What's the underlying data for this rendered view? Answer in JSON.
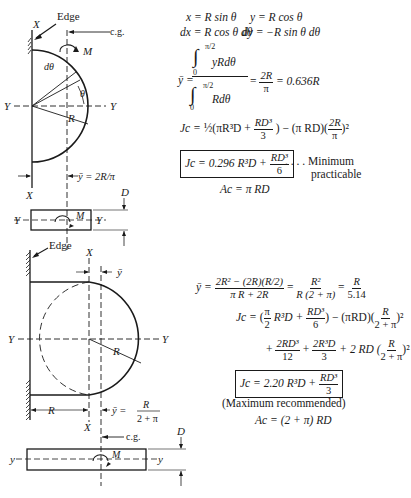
{
  "diagram_top": {
    "labels": {
      "edge": "Edge",
      "cg": "c.g.",
      "x_top": "X",
      "x_bottom": "X",
      "y_left": "Y",
      "y_right": "Y",
      "moment": "M",
      "dtheta": "dθ",
      "theta": "θ",
      "radius": "R",
      "ybar": "ȳ = 2R/π",
      "section_y_left": "Y",
      "section_y_right": "Y",
      "section_moment": "M",
      "depth": "D"
    }
  },
  "equations_top": {
    "line1_left": "x = R sin θ",
    "line1_right": "y = R cos θ",
    "line2_left": "dx = R cos θ dθ",
    "line2_right": "dy = −R sin θ dθ",
    "ybar_lhs": "ȳ =",
    "int_upper": "π/2",
    "int_lower": "0",
    "int_num": "yRdθ",
    "int_den": "Rdθ",
    "ybar_result_num": "2R",
    "ybar_result_den": "π",
    "ybar_value": "= 0.636R",
    "jc_full": "J_c = ½(πR³D + RD³/3) − (πRD)(2R/π)²",
    "jc_lhs": "Jc =",
    "jc_part1": "½(πR³D +",
    "jc_frac_num": "RD³",
    "jc_frac_den": "3",
    "jc_part2": ") − (π RD)(",
    "jc_frac2_num": "2R",
    "jc_frac2_den": "π",
    "jc_part3": ")²",
    "boxed_lhs": "Jc = 0.296 R³D +",
    "boxed_frac_num": "RD³",
    "boxed_frac_den": "6",
    "note_line1": ". . . . Minimum",
    "note_line2": "practicable",
    "area": "Ac = π RD"
  },
  "diagram_bottom": {
    "labels": {
      "edge": "Edge",
      "x_top": "X",
      "x_bottom": "X",
      "ybar_top": "ȳ",
      "y_left": "Y",
      "y_right": "Y",
      "radius": "R",
      "dim_r": "R",
      "ybar_eq": "ȳ =",
      "ybar_num": "R",
      "ybar_den": "2 + π",
      "cg": "c.g.",
      "section_y_left": "y",
      "section_y_right": "y",
      "section_moment": "M",
      "depth": "D"
    }
  },
  "equations_bottom": {
    "ybar_lhs": "ȳ =",
    "ybar_num1": "2R² − (2R)(R/2)",
    "ybar_den1": "π R + 2R",
    "ybar_num2": "R²",
    "ybar_den2": "R (2 + π)",
    "ybar_num3": "R",
    "ybar_den3": "5.14",
    "jc_lhs": "Jc =",
    "jc_l1_a": "(",
    "jc_l1_pi_num": "π",
    "jc_l1_pi_den": "2",
    "jc_l1_b": "R³D +",
    "jc_l1_f_num": "RD³",
    "jc_l1_f_den": "6",
    "jc_l1_c": ") − (πRD)(",
    "jc_l1_g_num": "R",
    "jc_l1_g_den": "2 + π",
    "jc_l1_d": ")²",
    "jc_l2_a": "+",
    "jc_l2_f1_num": "2RD³",
    "jc_l2_f1_den": "12",
    "jc_l2_b": "+",
    "jc_l2_f2_num": "2R³D",
    "jc_l2_f2_den": "3",
    "jc_l2_c": "+ 2 RD (",
    "jc_l2_g_num": "R",
    "jc_l2_g_den": "2 + π",
    "jc_l2_d": ")²",
    "boxed_lhs": "Jc = 2.20 R³D +",
    "boxed_frac_num": "RD³",
    "boxed_frac_den": "3",
    "note": "(Maximum recommended)",
    "area": "Ac = (2 + π) RD"
  }
}
